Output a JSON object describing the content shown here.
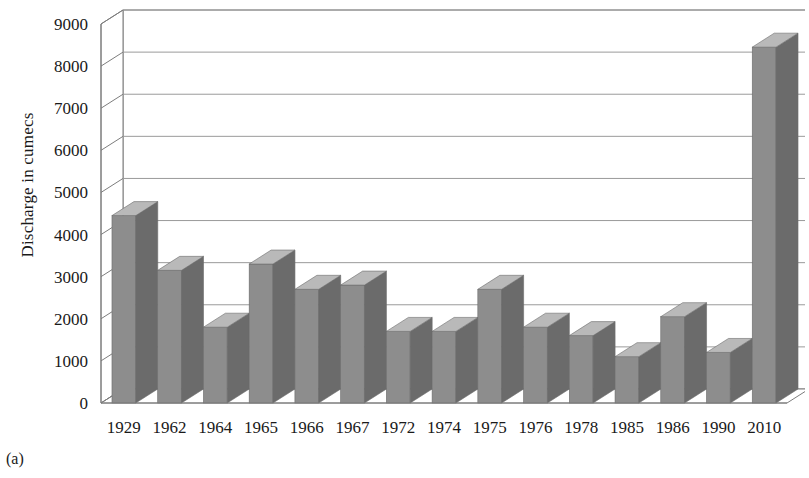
{
  "figure": {
    "caption": "(a)",
    "ylabel": "Discharge in cumecs"
  },
  "colors": {
    "bar_front": "#8d8d8d",
    "bar_side": "#6b6b6b",
    "bar_top": "#b9b9b9",
    "gridline": "#9a9a9a",
    "axis": "#7d7d7d",
    "wall": "#ffffff",
    "text": "#1a1a1a"
  },
  "chart_data": {
    "type": "bar",
    "title": "",
    "xlabel": "",
    "ylabel": "Discharge in cumecs",
    "ylim": [
      0,
      9000
    ],
    "ytick_values": [
      0,
      1000,
      2000,
      3000,
      4000,
      5000,
      6000,
      7000,
      8000,
      9000
    ],
    "ytick_labels": [
      "0",
      "1000",
      "2000",
      "3000",
      "4000",
      "5000",
      "6000",
      "7000",
      "8000",
      "9000"
    ],
    "grid": true,
    "legend": false,
    "three_d": true,
    "categories": [
      "1929",
      "1962",
      "1964",
      "1965",
      "1966",
      "1967",
      "1972",
      "1974",
      "1975",
      "1976",
      "1978",
      "1985",
      "1986",
      "1990",
      "2010"
    ],
    "values": [
      4450,
      3150,
      1800,
      3300,
      2700,
      2800,
      1700,
      1700,
      2700,
      1800,
      1600,
      1100,
      2050,
      1200,
      8450
    ]
  }
}
